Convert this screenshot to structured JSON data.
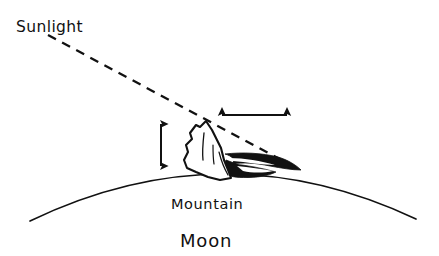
{
  "figure": {
    "background_color": "#ffffff",
    "ink_color": "#111111",
    "width": 439,
    "height": 256
  },
  "labels": {
    "sunlight": "Sunlight",
    "mountain": "Mountain",
    "moon": "Moon"
  },
  "diagram_data": {
    "type": "diagram",
    "subject": "Measuring lunar mountain height from its shadow length",
    "elements": [
      {
        "name": "sunlight-ray",
        "kind": "dashed-line",
        "label": "Sunlight",
        "from": [
          48,
          35
        ],
        "to": [
          300,
          170
        ],
        "dash_pattern": "9 7",
        "stroke_width": 2.2
      },
      {
        "name": "moon-limb",
        "kind": "arc",
        "label": "Moon",
        "from": [
          30,
          221
        ],
        "to": [
          416,
          219
        ],
        "apex": [
          223,
          159
        ],
        "stroke_width": 1.6
      },
      {
        "name": "mountain-peak",
        "kind": "filled-outline",
        "label": "Mountain",
        "peak": [
          206,
          122
        ],
        "base_left": [
          185,
          170
        ],
        "base_right": [
          232,
          178
        ]
      },
      {
        "name": "mountain-shadow",
        "kind": "filled-black-region",
        "from": [
          230,
          155
        ],
        "to": [
          300,
          170
        ]
      },
      {
        "name": "height-arrow",
        "kind": "double-headed-arrow",
        "orientation": "vertical",
        "x": 161,
        "y_top": 118,
        "y_bottom": 172,
        "measures": "mountain height",
        "stroke_width": 2.0
      },
      {
        "name": "shadow-length-arrow",
        "kind": "double-headed-arrow",
        "orientation": "horizontal",
        "y": 115,
        "x_left": 216,
        "x_right": 293,
        "measures": "shadow length",
        "stroke_width": 2.0
      }
    ]
  }
}
